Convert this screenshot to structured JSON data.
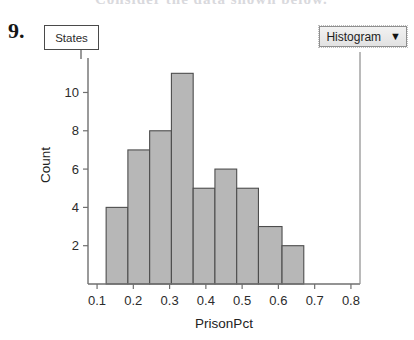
{
  "page": {
    "question_number": "9.",
    "faded_header_text": "Consider the data shown below."
  },
  "title_box": {
    "label": "States"
  },
  "dropdown": {
    "label": "Histogram",
    "caret_icon": "chevron-down-icon"
  },
  "chart_data": {
    "type": "bar",
    "title": "States",
    "xlabel": "PrisonPct",
    "ylabel": "Count",
    "categories": [
      "0.125-0.175",
      "0.175-0.225",
      "0.225-0.275",
      "0.275-0.325",
      "0.325-0.375",
      "0.375-0.425",
      "0.425-0.475",
      "0.475-0.525",
      "0.525-0.575"
    ],
    "bin_edges": [
      0.125,
      0.175,
      0.225,
      0.275,
      0.325,
      0.375,
      0.425,
      0.475,
      0.525,
      0.575
    ],
    "bar_left_edges": [
      0.125,
      0.185,
      0.245,
      0.305,
      0.365,
      0.425,
      0.485,
      0.545,
      0.61
    ],
    "bar_right_edges": [
      0.185,
      0.245,
      0.305,
      0.365,
      0.425,
      0.485,
      0.545,
      0.61,
      0.67
    ],
    "values": [
      4,
      7,
      8,
      11,
      5,
      6,
      5,
      3,
      2
    ],
    "xlim": [
      0.075,
      0.825
    ],
    "ylim": [
      0,
      11.8
    ],
    "xticks": [
      0.1,
      0.2,
      0.3,
      0.4,
      0.5,
      0.6,
      0.7,
      0.8
    ],
    "xtick_labels": [
      "0.1",
      "0.2",
      "0.3",
      "0.4",
      "0.5",
      "0.6",
      "0.7",
      "0.8"
    ],
    "yticks": [
      2,
      4,
      6,
      8,
      10
    ],
    "ytick_labels": [
      "2",
      "4",
      "6",
      "8",
      "10"
    ],
    "grid": false,
    "legend": false,
    "bar_fill_color": "#b7b7b7",
    "bar_edge_color": "#4d4d4d",
    "axis_color": "#6f6f6f"
  }
}
